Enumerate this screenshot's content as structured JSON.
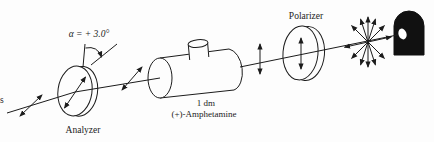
{
  "figure": {
    "background_color": "#fdfdfd",
    "ink_color": "#1c1c1c",
    "lamp_color": "#111111",
    "labels": {
      "left_text_fragment": "s",
      "rotation_angle": "α = + 3.0°",
      "analyzer": "Analyzer",
      "tube_length": "1 dm",
      "sample_name": "(+)-Amphetamine",
      "polarizer": "Polarizer"
    }
  }
}
